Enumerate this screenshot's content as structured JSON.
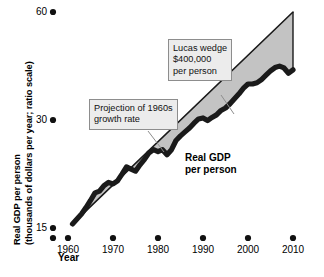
{
  "chart_data": {
    "type": "area",
    "title": "",
    "xlabel": "Year",
    "ylabel": "Real GDP per person (thousands of dollars per year; ratio scale)",
    "ylabel_line1": "Real GDP per person",
    "ylabel_line2": "(thousands of dollars per year; ratio scale)",
    "scale": "ratio (logarithmic)",
    "grid": false,
    "legend": "none",
    "xlim": [
      1960,
      2010
    ],
    "ylim": [
      15,
      60
    ],
    "yticks": [
      15,
      30,
      60
    ],
    "ytick_labels": [
      "15",
      "30",
      "60"
    ],
    "xticks": [
      1960,
      1970,
      1980,
      1990,
      2000,
      2010
    ],
    "xtick_labels": [
      "1960",
      "1970",
      "1980",
      "1990",
      "2000",
      "2010"
    ],
    "series": [
      {
        "name": "Projection of 1960s growth rate",
        "style": "straight-line",
        "x": [
          1961,
          2010
        ],
        "values": [
          15.4,
          60.0
        ]
      },
      {
        "name": "Real GDP per person",
        "style": "thick-wavy-line",
        "x": [
          1961,
          1962,
          1963,
          1964,
          1965,
          1966,
          1967,
          1968,
          1969,
          1970,
          1971,
          1972,
          1973,
          1974,
          1975,
          1976,
          1977,
          1978,
          1979,
          1980,
          1981,
          1982,
          1983,
          1984,
          1985,
          1986,
          1987,
          1988,
          1989,
          1990,
          1991,
          1992,
          1993,
          1994,
          1995,
          1996,
          1997,
          1998,
          1999,
          2000,
          2001,
          2002,
          2003,
          2004,
          2005,
          2006,
          2007,
          2008,
          2009,
          2010
        ],
        "values": [
          15.4,
          15.9,
          16.4,
          17.1,
          17.9,
          18.8,
          19.0,
          19.7,
          20.1,
          19.9,
          20.3,
          21.2,
          22.2,
          21.9,
          21.6,
          22.5,
          23.3,
          24.3,
          24.8,
          24.5,
          24.8,
          24.0,
          24.8,
          26.3,
          27.1,
          27.8,
          28.5,
          29.4,
          30.2,
          30.4,
          29.9,
          30.5,
          31.0,
          31.9,
          32.4,
          33.3,
          34.4,
          35.5,
          36.8,
          37.8,
          37.8,
          38.1,
          38.9,
          40.0,
          41.1,
          42.0,
          42.4,
          41.9,
          40.5,
          41.4
        ]
      }
    ],
    "shaded_region": {
      "name": "Lucas wedge",
      "between": [
        "Projection of 1960s growth rate",
        "Real GDP per person"
      ],
      "fill_color": "#c3c3c3"
    },
    "annotations": [
      {
        "id": "lucas-wedge",
        "lines": [
          "Lucas wedge",
          "$400,000",
          "per person"
        ],
        "text": "Lucas wedge $400,000 per person",
        "points_to": "shaded wedge area"
      },
      {
        "id": "projection",
        "lines": [
          "Projection of 1960s",
          "growth rate"
        ],
        "text": "Projection of 1960s growth rate",
        "points_to": "upper straight projection line"
      }
    ],
    "series_labels": [
      {
        "id": "real-gdp",
        "lines": [
          "Real GDP",
          "per person"
        ],
        "text": "Real GDP per person"
      }
    ],
    "colors": {
      "curve": "#1a1a1a",
      "wedge_fill": "#c3c3c3",
      "projection_line": "#1a1a1a",
      "callout_bg": "#ececec",
      "callout_border": "#8d8d8d",
      "background": "#ffffff"
    }
  }
}
